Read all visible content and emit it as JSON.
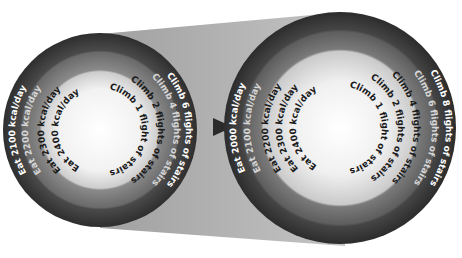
{
  "diagram": {
    "type": "concentric-rings-comparison",
    "connector": {
      "shape": "trapezoid",
      "color": "#b4b4b4"
    },
    "arrow": {
      "icon": "right-triangle-arrow",
      "color": "#2a2a2a"
    },
    "left_circle": {
      "eat_labels": [
        "Eat 2100 kcal/day",
        "Eat 2200 kcal/day",
        "Eat 2300 kcal/day",
        "Eat 2400 kcal/day"
      ],
      "climb_labels": [
        "Climb 6 flights of stairs",
        "Climb 4 flights of stairs",
        "Climb 2 flights of stairs",
        "Climb 1 flight of stairs"
      ]
    },
    "right_circle": {
      "eat_labels": [
        "Eat 2000 kcal/day",
        "Eat 2100 kcal/day",
        "Eat 2200 kcal/day",
        "Eat 2300 kcal/day",
        "Eat 2400 kcal/day"
      ],
      "climb_labels": [
        "Climb 8 flights of stairs",
        "Climb 6 flights of stairs",
        "Climb 4 flights of stairs",
        "Climb 2 flights of stairs",
        "Climb 1 flight of stairs"
      ]
    },
    "colors": {
      "ring_outer": "#3a3a3a",
      "ring_second": "#6e6e6e",
      "ring_third": "#cfcfcf",
      "center": "#ffffff",
      "text_light": "#ffffff",
      "text_muted": "#d8d8d8",
      "text_dark": "#1a1a1a"
    }
  }
}
